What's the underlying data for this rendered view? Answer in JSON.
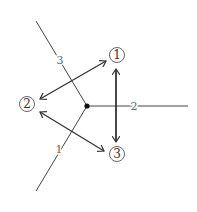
{
  "diagram": {
    "center": {
      "x": 87,
      "y": 106
    },
    "rays": [
      {
        "id": "ray-3",
        "label": "3",
        "end": {
          "x": 36,
          "y": 21
        },
        "label_pos": {
          "x": 60,
          "y": 64
        }
      },
      {
        "id": "ray-2",
        "label": "2",
        "end": {
          "x": 188,
          "y": 106
        },
        "label_pos": {
          "x": 134,
          "y": 110
        }
      },
      {
        "id": "ray-1",
        "label": "1",
        "end": {
          "x": 36,
          "y": 191
        },
        "label_pos": {
          "x": 59,
          "y": 153
        }
      }
    ],
    "nodes": [
      {
        "id": "node-1",
        "label": "1",
        "x": 117,
        "y": 55
      },
      {
        "id": "node-2",
        "label": "2",
        "x": 27,
        "y": 104
      },
      {
        "id": "node-3",
        "label": "3",
        "x": 117,
        "y": 154
      }
    ],
    "arrows": [
      {
        "id": "arrow-2-1",
        "from": {
          "x": 40,
          "y": 99
        },
        "to": {
          "x": 106,
          "y": 61
        }
      },
      {
        "id": "arrow-2-3",
        "from": {
          "x": 40,
          "y": 112
        },
        "to": {
          "x": 104,
          "y": 151
        }
      },
      {
        "id": "arrow-1-3",
        "from": {
          "x": 116,
          "y": 69
        },
        "to": {
          "x": 116,
          "y": 142
        }
      }
    ],
    "colors": {
      "line": "#444444",
      "arrow": "#333333",
      "label": "#666666"
    }
  }
}
